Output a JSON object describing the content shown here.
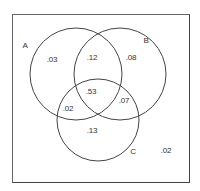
{
  "diagram": {
    "type": "venn-3",
    "sets": [
      {
        "id": "A",
        "label": "A"
      },
      {
        "id": "B",
        "label": "B"
      },
      {
        "id": "C",
        "label": "C"
      }
    ],
    "regions": {
      "A_only": ".03",
      "A_and_B_only": ".12",
      "B_only": ".08",
      "A_and_B_and_C": ".53",
      "A_and_C_only": ".02",
      "B_and_C_only": ".07",
      "C_only": ".13",
      "outside": ".02"
    },
    "colors": {
      "stroke": "#444444",
      "text": "#333333",
      "background": "#ffffff"
    }
  }
}
